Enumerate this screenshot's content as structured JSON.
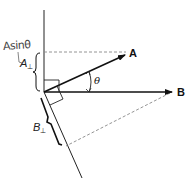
{
  "diagram": {
    "vectors": [
      {
        "name": "A",
        "label": "A"
      },
      {
        "name": "B",
        "label": "B"
      }
    ],
    "angle_label": "θ",
    "a_perp": {
      "letter": "A",
      "sub": "⊥"
    },
    "b_perp": {
      "letter": "B",
      "sub": "⊥"
    },
    "handwritten_note": "Asinθ",
    "colors": {
      "line": "#111111",
      "dashed": "#777777",
      "handwriting": "#555555"
    }
  }
}
